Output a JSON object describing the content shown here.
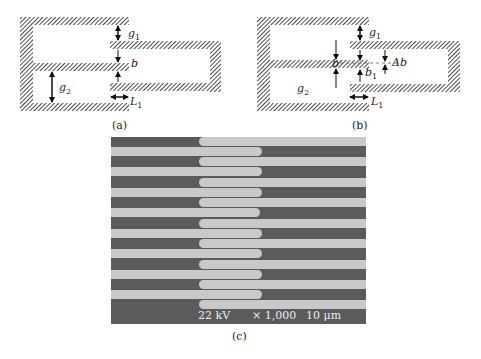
{
  "figure": {
    "panels": [
      {
        "id": "a",
        "caption": "(a)",
        "labels": {
          "g1": "g",
          "g1_sub": "1",
          "b": "b",
          "g2": "g",
          "g2_sub": "2",
          "L1": "L",
          "L1_sub": "1"
        }
      },
      {
        "id": "b",
        "caption": "(b)",
        "labels": {
          "g1": "g",
          "g1_sub": "1",
          "b": "b",
          "b1": "b",
          "b1_sub": "1",
          "delta_b": "Δb",
          "g2": "g",
          "g2_sub": "2",
          "L1": "L",
          "L1_sub": "1"
        }
      },
      {
        "id": "c",
        "caption": "(c)",
        "sem": {
          "voltage": "22 kV",
          "magnification": "× 1,000",
          "scale": "10 μm",
          "left_comb_fingers": 8,
          "right_comb_fingers": 9
        }
      }
    ],
    "colors": {
      "hatch": "#222222",
      "sem_background": "#5b5b5b",
      "sem_finger": "#c9c9c9"
    }
  }
}
